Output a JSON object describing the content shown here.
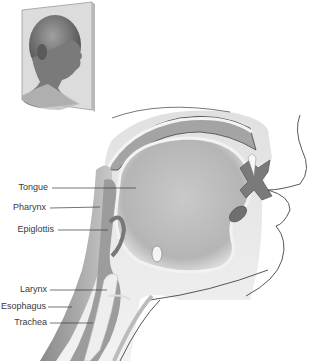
{
  "figure": {
    "portrait": {
      "description": "Inset portrait of man in profile facing right"
    },
    "labels": [
      {
        "id": "tongue",
        "text": "Tongue",
        "label_x": 62,
        "label_y": 187,
        "line_end_x": 136,
        "line_end_y": 188
      },
      {
        "id": "pharynx",
        "text": "Pharynx",
        "label_x": 56,
        "label_y": 207,
        "line_end_x": 100,
        "line_end_y": 207
      },
      {
        "id": "epiglottis",
        "text": "Epiglottis",
        "label_x": 54,
        "label_y": 229,
        "line_end_x": 108,
        "line_end_y": 230
      },
      {
        "id": "larynx",
        "text": "Larynx",
        "label_x": 50,
        "label_y": 290,
        "line_end_x": 107,
        "line_end_y": 290
      },
      {
        "id": "esophagus",
        "text": "Esophagus",
        "label_x": 50,
        "label_y": 306,
        "line_end_x": 72,
        "line_end_y": 306
      },
      {
        "id": "trachea",
        "text": "Trachea",
        "label_x": 50,
        "label_y": 323,
        "line_end_x": 93,
        "line_end_y": 323
      }
    ]
  }
}
